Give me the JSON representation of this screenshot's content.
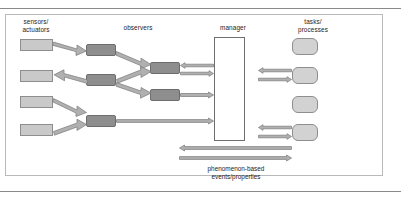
{
  "figure": {
    "type": "layered-architecture-diagram",
    "caption": "phenomenon-based\nevents/properties"
  },
  "columns": {
    "sensors": {
      "label": "sensors/\nactuators"
    },
    "observers": {
      "label": "observers"
    },
    "manager": {
      "label": "manager"
    },
    "tasks": {
      "label": "tasks/\nprocesses"
    }
  },
  "colors": {
    "sensor_fill": "#c9c9c9",
    "observer_fill": "#8e8e8e",
    "manager_fill": "#ffffff",
    "task_fill": "#d2d2d2",
    "arrow_fill": "#b0b0b0",
    "arrow_stroke": "#7a7a7a",
    "frame_stroke": "#b9b9b9",
    "rule_stroke": "#8a8a8a"
  },
  "nodes": {
    "sensors": [
      {
        "id": "sensor-1"
      },
      {
        "id": "sensor-2"
      },
      {
        "id": "sensor-3"
      },
      {
        "id": "sensor-4"
      }
    ],
    "observers_col1": [
      {
        "id": "observer-1"
      },
      {
        "id": "observer-2"
      },
      {
        "id": "observer-3"
      }
    ],
    "observers_col2": [
      {
        "id": "observer-4"
      },
      {
        "id": "observer-5"
      }
    ],
    "manager": {
      "id": "manager"
    },
    "tasks": [
      {
        "id": "task-1"
      },
      {
        "id": "task-2"
      },
      {
        "id": "task-3"
      },
      {
        "id": "task-4"
      }
    ]
  },
  "connections": {
    "sensor_to_observer": [
      {
        "id": "arrow-sensor1-observer1",
        "direction": "right-down"
      },
      {
        "id": "arrow-observer2-sensor2",
        "direction": "left-up"
      },
      {
        "id": "arrow-sensor3-observer3",
        "direction": "right-down"
      },
      {
        "id": "arrow-sensor4-observer3",
        "direction": "right-up"
      }
    ],
    "observer_to_observer": [
      {
        "id": "arrow-observer1-observer4",
        "direction": "right-down"
      },
      {
        "id": "arrow-observer2-observer4",
        "direction": "right-up"
      },
      {
        "id": "arrow-observer2-observer5",
        "direction": "right-down"
      }
    ],
    "observer_to_manager": [
      {
        "id": "arrow-manager-observer4",
        "direction": "left"
      },
      {
        "id": "arrow-observer4-manager",
        "direction": "right"
      },
      {
        "id": "arrow-observer5-manager",
        "direction": "right"
      },
      {
        "id": "arrow-observer3-manager",
        "direction": "right"
      }
    ],
    "manager_to_tasks": [
      {
        "id": "arrow-task2-manager",
        "direction": "left"
      },
      {
        "id": "arrow-manager-task2",
        "direction": "right"
      },
      {
        "id": "arrow-task4-manager",
        "direction": "left"
      },
      {
        "id": "arrow-manager-task4",
        "direction": "right"
      }
    ],
    "phenomenon_bus": [
      {
        "id": "arrow-bus-left",
        "direction": "left"
      },
      {
        "id": "arrow-bus-right",
        "direction": "right"
      }
    ]
  }
}
